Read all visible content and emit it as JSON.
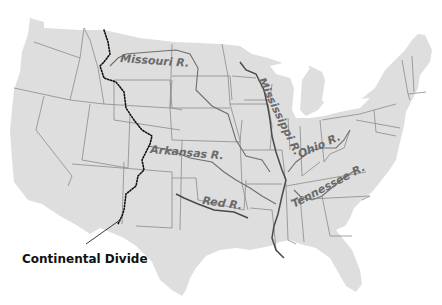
{
  "map": {
    "title": "United States Major Rivers",
    "colors": {
      "land": "#dedede",
      "state_border": "#8a8a8a",
      "river": "#6e6e6e",
      "label": "#6a6a6a",
      "divide": "#111111",
      "background": "#ffffff"
    },
    "rivers": [
      {
        "name": "missouri",
        "label": "Missouri R."
      },
      {
        "name": "mississippi",
        "label": "Mississippi R."
      },
      {
        "name": "arkansas",
        "label": "Arkansas R."
      },
      {
        "name": "ohio",
        "label": "Ohio R."
      },
      {
        "name": "red",
        "label": "Red R."
      },
      {
        "name": "tennessee",
        "label": "Tennessee R."
      }
    ],
    "annotations": {
      "continental_divide": "Continental Divide"
    }
  }
}
